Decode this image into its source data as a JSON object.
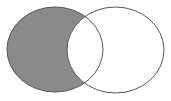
{
  "diagram": {
    "type": "venn",
    "sets": [
      {
        "id": "A",
        "position": "left",
        "shaded": true
      },
      {
        "id": "B",
        "position": "right",
        "shaded": false
      }
    ],
    "shaded_region": "A minus B",
    "colors": {
      "background": "#ffffff",
      "shade": "#8a8a8a",
      "stroke": "#555555"
    }
  }
}
